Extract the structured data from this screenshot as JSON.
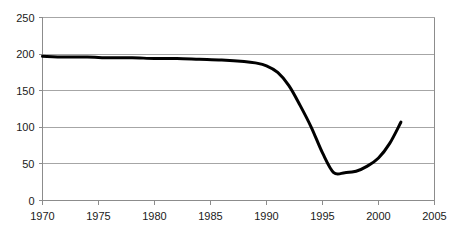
{
  "chart_data": {
    "type": "line",
    "title": "",
    "subtitle": "",
    "xlabel": "",
    "ylabel": "",
    "xlim": [
      1970,
      2005
    ],
    "ylim": [
      0,
      250
    ],
    "grid": true,
    "legend": false,
    "legend_position": "none",
    "y_ticks": [
      250,
      200,
      150,
      100,
      50,
      0
    ],
    "y_tick_labels": [
      "250",
      "200",
      "150",
      "100",
      "50",
      "0"
    ],
    "x_ticks": [
      1970,
      1975,
      1980,
      1985,
      1990,
      1995,
      2000,
      2005
    ],
    "x_tick_labels": [
      "1970",
      "1975",
      "1980",
      "1985",
      "1990",
      "1995",
      "2000",
      "2005"
    ],
    "series": [
      {
        "name": "series-1",
        "color": "#000000",
        "x": [
          1970,
          1972,
          1974,
          1976,
          1978,
          1980,
          1982,
          1984,
          1986,
          1988,
          1989,
          1990,
          1991,
          1992,
          1993,
          1994,
          1995,
          1996,
          1997,
          1998,
          1999,
          2000,
          2001,
          2002
        ],
        "values": [
          197,
          196,
          196,
          195,
          195,
          194,
          194,
          193,
          192,
          190,
          188,
          184,
          175,
          157,
          130,
          100,
          65,
          38,
          38,
          40,
          47,
          58,
          78,
          107
        ]
      }
    ],
    "annotations": []
  },
  "axes": {
    "y_axis_name": "y-axis",
    "x_axis_name": "x-axis"
  }
}
